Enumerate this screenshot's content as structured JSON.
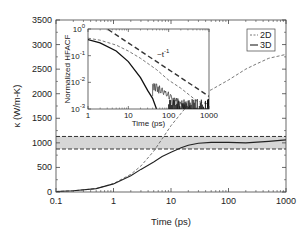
{
  "chart_data": [
    {
      "id": "main",
      "type": "line",
      "title": "",
      "xlabel": "Time (ps)",
      "ylabel": "κ (W/m-K)",
      "xscale": "log",
      "xlim": [
        0.1,
        1000
      ],
      "ylim": [
        0,
        3500
      ],
      "xticks": [
        "0.1",
        "1",
        "10",
        "100",
        "1000"
      ],
      "yticks": [
        "0",
        "500",
        "1000",
        "1500",
        "2000",
        "2500",
        "3000",
        "3500"
      ],
      "grid": false,
      "legend": {
        "position": "upper right",
        "entries": [
          "2D",
          "3D"
        ]
      },
      "band": {
        "lower": 875,
        "upper": 1130,
        "style": "shaded gray with dashed edges"
      },
      "series": [
        {
          "name": "2D",
          "style": "dashed thin",
          "x": [
            0.1,
            0.2,
            0.5,
            1,
            2,
            3,
            5,
            7,
            10,
            20,
            30,
            50,
            100,
            200,
            300,
            500,
            700,
            1000
          ],
          "y": [
            10,
            25,
            70,
            170,
            360,
            530,
            830,
            1080,
            1350,
            1780,
            1960,
            2080,
            2280,
            2500,
            2600,
            2720,
            2760,
            2800
          ]
        },
        {
          "name": "3D",
          "style": "solid",
          "x": [
            0.1,
            0.2,
            0.5,
            1,
            2,
            3,
            5,
            7,
            10,
            15,
            20,
            30,
            50,
            100,
            200,
            500,
            1000
          ],
          "y": [
            10,
            25,
            70,
            165,
            330,
            460,
            610,
            720,
            810,
            900,
            950,
            990,
            1010,
            1010,
            1000,
            1030,
            1060
          ]
        }
      ]
    },
    {
      "id": "inset",
      "type": "line",
      "title": "",
      "xlabel": "Time (ps)",
      "ylabel": "Normalized HFACF",
      "xscale": "log",
      "yscale": "log",
      "xlim": [
        1,
        1000
      ],
      "ylim": [
        0.001,
        1
      ],
      "xticks": [
        "1",
        "10",
        "100",
        "1000"
      ],
      "yticks": [
        "10^-3",
        "10^-2",
        "10^-1",
        "10^0"
      ],
      "annotation": "~t^-1",
      "series": [
        {
          "name": "2D",
          "style": "dashed thin",
          "x": [
            1,
            2,
            5,
            10,
            20,
            50,
            100,
            200,
            500,
            1000
          ],
          "y": [
            0.45,
            0.38,
            0.25,
            0.15,
            0.08,
            0.03,
            0.012,
            0.006,
            0.002,
            0.0015
          ]
        },
        {
          "name": "3D",
          "style": "solid",
          "x": [
            1,
            2,
            5,
            10,
            20,
            30,
            40,
            50
          ],
          "y": [
            0.4,
            0.3,
            0.15,
            0.06,
            0.015,
            0.005,
            0.0025,
            0.001
          ]
        },
        {
          "name": "t^-1 reference",
          "style": "dashed thick",
          "x": [
            1,
            10,
            100,
            1000
          ],
          "y": [
            3,
            0.3,
            0.03,
            0.003
          ]
        }
      ]
    }
  ],
  "labels": {
    "xlabel": "Time (ps)",
    "ylabel": "κ (W/m-K)",
    "inset_ylabel": "Normalized HFACF",
    "inset_xlabel": "Time (ps)",
    "annotation": "~t",
    "annotation_exp": "-1",
    "legend_2d": "2D",
    "legend_3d": "3D"
  }
}
